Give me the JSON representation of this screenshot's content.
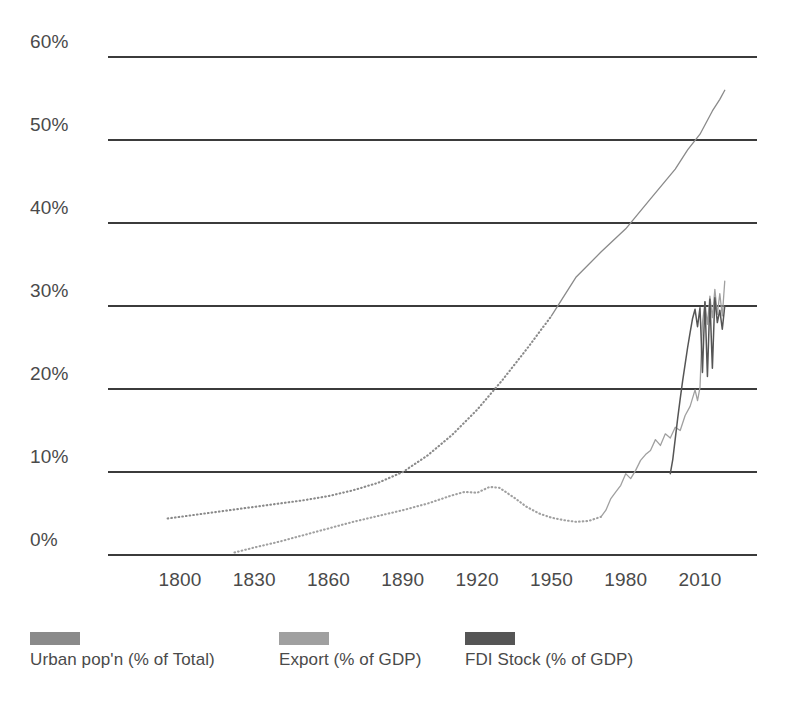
{
  "chart_data": {
    "type": "line",
    "title": "",
    "subtitle": "",
    "xlabel": "",
    "ylabel": "",
    "xlim": [
      1790,
      2022
    ],
    "ylim": [
      0,
      60
    ],
    "grid": true,
    "y_ticks": [
      "0%",
      "10%",
      "20%",
      "30%",
      "40%",
      "50%",
      "60%"
    ],
    "y_tick_values": [
      0,
      10,
      20,
      30,
      40,
      50,
      60
    ],
    "x_ticks": [
      "1800",
      "1830",
      "1860",
      "1890",
      "1920",
      "1950",
      "1980",
      "2010"
    ],
    "x_tick_values": [
      1800,
      1830,
      1860,
      1890,
      1920,
      1950,
      1980,
      2010
    ],
    "legend_position": "bottom-left",
    "series": [
      {
        "name": "Urban pop'n (% of Total)",
        "color": "#8a8a8a",
        "style": "dotted-then-solid",
        "solid_from": 1950,
        "x": [
          1795,
          1800,
          1810,
          1820,
          1830,
          1840,
          1850,
          1860,
          1870,
          1880,
          1890,
          1900,
          1910,
          1920,
          1930,
          1940,
          1950,
          1960,
          1970,
          1980,
          1990,
          2000,
          2005,
          2010,
          2015,
          2018,
          2020
        ],
        "values": [
          4.4,
          4.6,
          5.0,
          5.4,
          5.8,
          6.2,
          6.6,
          7.1,
          7.8,
          8.7,
          10.0,
          12.0,
          14.5,
          17.5,
          21.0,
          24.8,
          28.8,
          33.5,
          36.5,
          39.3,
          42.9,
          46.5,
          48.8,
          50.7,
          53.5,
          54.9,
          56.0
        ]
      },
      {
        "name": "Export (% of GDP)",
        "color": "#a0a0a0",
        "style": "dotted-then-solid",
        "solid_from": 1970,
        "x": [
          1822,
          1830,
          1840,
          1850,
          1860,
          1870,
          1880,
          1890,
          1900,
          1910,
          1915,
          1920,
          1925,
          1929,
          1935,
          1940,
          1945,
          1950,
          1955,
          1960,
          1965,
          1970,
          1972,
          1974,
          1976,
          1978,
          1980,
          1982,
          1984,
          1986,
          1988,
          1990,
          1992,
          1994,
          1996,
          1998,
          2000,
          2002,
          2004,
          2006,
          2008,
          2009,
          2010,
          2011,
          2012,
          2013,
          2014,
          2015,
          2016,
          2017,
          2018,
          2019,
          2020
        ],
        "values": [
          0.3,
          0.9,
          1.6,
          2.4,
          3.2,
          4.0,
          4.7,
          5.4,
          6.2,
          7.2,
          7.6,
          7.5,
          8.2,
          8.1,
          6.9,
          5.8,
          5.0,
          4.5,
          4.2,
          4.0,
          4.1,
          4.6,
          5.4,
          6.8,
          7.6,
          8.4,
          9.8,
          9.2,
          10.2,
          11.4,
          12.1,
          12.6,
          13.9,
          13.2,
          14.6,
          14.1,
          15.4,
          15.0,
          16.8,
          17.9,
          19.9,
          18.6,
          20.2,
          28.0,
          30.5,
          27.8,
          31.2,
          28.6,
          32.0,
          29.0,
          31.5,
          28.8,
          33.0
        ]
      },
      {
        "name": "FDI Stock (% of GDP)",
        "color": "#555555",
        "style": "solid",
        "x": [
          1998,
          1999,
          2000,
          2001,
          2002,
          2003,
          2004,
          2005,
          2006,
          2007,
          2008,
          2009,
          2010,
          2011,
          2012,
          2013,
          2014,
          2015,
          2016,
          2017,
          2018,
          2019,
          2020
        ],
        "values": [
          9.8,
          11.5,
          14.0,
          16.5,
          18.8,
          21.0,
          23.0,
          25.0,
          26.8,
          28.5,
          29.6,
          27.5,
          29.8,
          22.0,
          30.5,
          21.5,
          30.8,
          22.5,
          31.0,
          28.0,
          29.5,
          27.2,
          30.0
        ]
      }
    ]
  },
  "legend": {
    "items": [
      {
        "label": "Urban pop'n (% of Total)",
        "color": "#8a8a8a"
      },
      {
        "label": "Export (% of GDP)",
        "color": "#a0a0a0"
      },
      {
        "label": "FDI Stock (% of GDP)",
        "color": "#555555"
      }
    ]
  },
  "source_note": ""
}
